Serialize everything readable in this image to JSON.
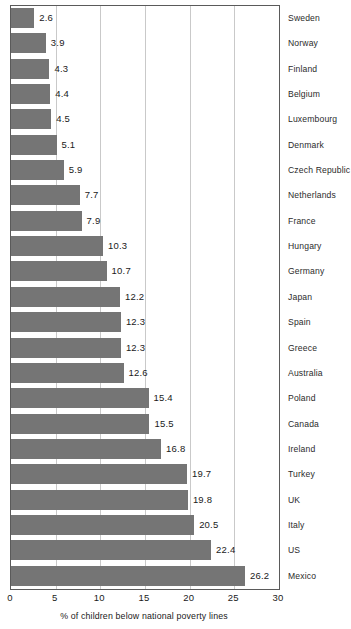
{
  "chart_data": {
    "type": "bar",
    "orientation": "horizontal",
    "title": "",
    "xlabel": "% of children below national poverty lines",
    "ylabel": "",
    "xlim": [
      0,
      30
    ],
    "xticks": [
      0,
      5,
      10,
      15,
      20,
      25,
      30
    ],
    "grid": true,
    "legend": false,
    "bar_color": "#757575",
    "categories": [
      "Sweden",
      "Norway",
      "Finland",
      "Belgium",
      "Luxembourg",
      "Denmark",
      "Czech Republic",
      "Netherlands",
      "France",
      "Hungary",
      "Germany",
      "Japan",
      "Spain",
      "Greece",
      "Australia",
      "Poland",
      "Canada",
      "Ireland",
      "Turkey",
      "UK",
      "Italy",
      "US",
      "Mexico"
    ],
    "values": [
      2.6,
      3.9,
      4.3,
      4.4,
      4.5,
      5.1,
      5.9,
      7.7,
      7.9,
      10.3,
      10.7,
      12.2,
      12.3,
      12.3,
      12.6,
      15.4,
      15.5,
      16.8,
      19.7,
      19.8,
      20.5,
      22.4,
      26.2
    ],
    "value_labels": [
      "2.6",
      "3.9",
      "4.3",
      "4.4",
      "4.5",
      "5.1",
      "5.9",
      "7.7",
      "7.9",
      "10.3",
      "10.7",
      "12.2",
      "12.3",
      "12.3",
      "12.6",
      "15.4",
      "15.5",
      "16.8",
      "19.7",
      "19.8",
      "20.5",
      "22.4",
      "26.2"
    ],
    "xtick_labels": [
      "0",
      "5",
      "10",
      "15",
      "20",
      "25",
      "30"
    ]
  }
}
